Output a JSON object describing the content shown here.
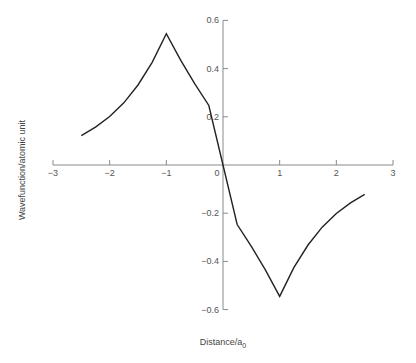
{
  "chart_data": {
    "type": "line",
    "title": "",
    "xlabel": "Distance/a",
    "xlabel_subscript": "0",
    "ylabel": "Wavefunction/atomic unit",
    "xlim": [
      -3,
      3
    ],
    "ylim": [
      -0.6,
      0.6
    ],
    "grid": false,
    "legend": "none",
    "x_ticks": [
      -3,
      -2,
      -1,
      0,
      1,
      2,
      3
    ],
    "x_tick_labels": [
      "−3",
      "−2",
      "−1",
      "0",
      "1",
      "2",
      "3"
    ],
    "y_ticks": [
      0.6,
      0.4,
      0.2,
      -0.2,
      -0.4,
      -0.6
    ],
    "y_tick_labels": [
      "0.6",
      "0.4",
      "0.2",
      "−0.2",
      "−0.4",
      "−0.6"
    ],
    "series": [
      {
        "name": "antisymmetric wavefunction",
        "color": "#222222",
        "x": [
          -2.5,
          -2.25,
          -2.0,
          -1.75,
          -1.5,
          -1.25,
          -1.0,
          -0.75,
          -0.5,
          -0.25,
          0.0,
          0.25,
          0.5,
          0.75,
          1.0,
          1.25,
          1.5,
          1.75,
          2.0,
          2.25,
          2.5
        ],
        "y": [
          0.122,
          0.157,
          0.201,
          0.258,
          0.332,
          0.426,
          0.545,
          0.436,
          0.338,
          0.247,
          0.0,
          -0.247,
          -0.338,
          -0.436,
          -0.545,
          -0.426,
          -0.332,
          -0.258,
          -0.201,
          -0.157,
          -0.122
        ]
      }
    ]
  }
}
